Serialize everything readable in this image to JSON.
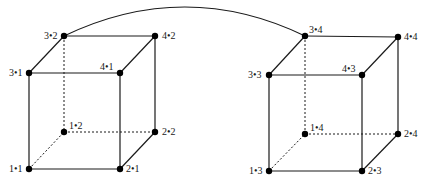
{
  "diagram": {
    "type": "two linked cubes (hypercube-style node graph)",
    "link": {
      "from": "3•2",
      "to": "3•4"
    },
    "cubes": [
      {
        "id": "left",
        "nodes": [
          {
            "label": "3•2",
            "x": 64,
            "y": 36,
            "lx": 44,
            "ly": 39
          },
          {
            "label": "4•2",
            "x": 155,
            "y": 36,
            "lx": 162,
            "ly": 39
          },
          {
            "label": "3•1",
            "x": 29,
            "y": 73,
            "lx": 9,
            "ly": 76
          },
          {
            "label": "4•1",
            "x": 120,
            "y": 73,
            "lx": 100,
            "ly": 70
          },
          {
            "label": "1•2",
            "x": 64,
            "y": 132,
            "lx": 69,
            "ly": 129
          },
          {
            "label": "2•2",
            "x": 155,
            "y": 132,
            "lx": 162,
            "ly": 135
          },
          {
            "label": "1•1",
            "x": 29,
            "y": 169,
            "lx": 9,
            "ly": 172
          },
          {
            "label": "2•1",
            "x": 120,
            "y": 169,
            "lx": 126,
            "ly": 172
          }
        ]
      },
      {
        "id": "right",
        "nodes": [
          {
            "label": "3•4",
            "x": 305,
            "y": 36,
            "lx": 309,
            "ly": 33
          },
          {
            "label": "4•4",
            "x": 398,
            "y": 37,
            "lx": 404,
            "ly": 40
          },
          {
            "label": "3•3",
            "x": 269,
            "y": 75,
            "lx": 248,
            "ly": 78
          },
          {
            "label": "4•3",
            "x": 362,
            "y": 75,
            "lx": 342,
            "ly": 72
          },
          {
            "label": "1•4",
            "x": 305,
            "y": 134,
            "lx": 310,
            "ly": 131
          },
          {
            "label": "2•4",
            "x": 398,
            "y": 134,
            "lx": 404,
            "ly": 137
          },
          {
            "label": "1•3",
            "x": 269,
            "y": 171,
            "lx": 249,
            "ly": 174
          },
          {
            "label": "2•3",
            "x": 362,
            "y": 171,
            "lx": 368,
            "ly": 174
          }
        ]
      }
    ]
  }
}
